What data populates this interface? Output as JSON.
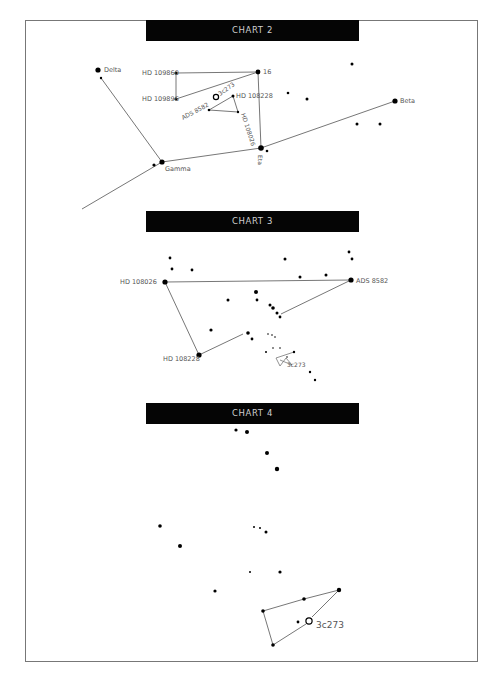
{
  "frame": {
    "x": 25,
    "y": 20,
    "w": 453,
    "h": 642
  },
  "colors": {
    "header_bg": "#050505",
    "header_text": "#cfcfcf",
    "line": "#777777",
    "star": "#000000",
    "label": "#555555"
  },
  "charts": [
    {
      "title": "CHART 2",
      "header": {
        "x": 146,
        "y": 20,
        "w": 213,
        "h": 21
      },
      "stars": [
        {
          "x": 98,
          "y": 70,
          "r": 2.6,
          "label": "Delta",
          "lx": 104,
          "ly": 72,
          "fs": 6.5
        },
        {
          "x": 101,
          "y": 78,
          "r": 1.2
        },
        {
          "x": 176,
          "y": 73,
          "r": 1.6,
          "label": "HD 109860",
          "lx": 142,
          "ly": 75,
          "fs": 6.5
        },
        {
          "x": 176,
          "y": 99,
          "r": 1.6,
          "label": "HD 109896",
          "lx": 142,
          "ly": 101,
          "fs": 6.5
        },
        {
          "x": 258,
          "y": 72,
          "r": 2.4,
          "label": "16",
          "lx": 263,
          "ly": 74,
          "fs": 6.5
        },
        {
          "x": 233,
          "y": 96,
          "r": 1.5,
          "label": "HD 108228",
          "lx": 236,
          "ly": 98,
          "fs": 6.5
        },
        {
          "x": 216,
          "y": 97,
          "r": 2,
          "ring": true,
          "label": "3c273",
          "lx": 220,
          "ly": 96,
          "fs": 6,
          "rot": -35
        },
        {
          "x": 209,
          "y": 110,
          "r": 1.3,
          "label": "ADS 8582",
          "lx": 183,
          "ly": 120,
          "fs": 6,
          "rot": -28
        },
        {
          "x": 238,
          "y": 112,
          "r": 1.2,
          "label": "HD 108026",
          "lx": 241,
          "ly": 114,
          "fs": 6,
          "rot": 72
        },
        {
          "x": 261,
          "y": 148,
          "r": 2.8,
          "label": "Eta",
          "lx": 258,
          "ly": 155,
          "fs": 6,
          "rot": 90
        },
        {
          "x": 267,
          "y": 151,
          "r": 1.3
        },
        {
          "x": 288,
          "y": 93,
          "r": 1.3
        },
        {
          "x": 307,
          "y": 99,
          "r": 1.5
        },
        {
          "x": 352,
          "y": 64,
          "r": 1.5
        },
        {
          "x": 395,
          "y": 101,
          "r": 2.6,
          "label": "Beta",
          "lx": 400,
          "ly": 103,
          "fs": 6.5
        },
        {
          "x": 357,
          "y": 124,
          "r": 1.5
        },
        {
          "x": 380,
          "y": 124,
          "r": 1.5
        },
        {
          "x": 162,
          "y": 162,
          "r": 2.6,
          "label": "Gamma",
          "lx": 165,
          "ly": 171,
          "fs": 6.5
        },
        {
          "x": 154,
          "y": 165,
          "r": 1.6
        }
      ],
      "lines": [
        [
          [
            101,
            78
          ],
          [
            162,
            162
          ]
        ],
        [
          [
            176,
            73
          ],
          [
            258,
            72
          ]
        ],
        [
          [
            176,
            73
          ],
          [
            176,
            99
          ]
        ],
        [
          [
            176,
            99
          ],
          [
            258,
            72
          ]
        ],
        [
          [
            258,
            72
          ],
          [
            261,
            148
          ]
        ],
        [
          [
            233,
            96
          ],
          [
            209,
            110
          ]
        ],
        [
          [
            209,
            110
          ],
          [
            238,
            112
          ]
        ],
        [
          [
            233,
            96
          ],
          [
            238,
            112
          ]
        ],
        [
          [
            82,
            209
          ],
          [
            162,
            162
          ]
        ],
        [
          [
            162,
            162
          ],
          [
            261,
            148
          ]
        ],
        [
          [
            261,
            148
          ],
          [
            395,
            101
          ]
        ]
      ]
    },
    {
      "title": "CHART 3",
      "header": {
        "x": 146,
        "y": 211,
        "w": 213,
        "h": 21
      },
      "stars": [
        {
          "x": 165,
          "y": 282,
          "r": 2.6,
          "label": "HD 108026",
          "lx": 120,
          "ly": 284,
          "fs": 6.5
        },
        {
          "x": 351,
          "y": 280,
          "r": 2.6,
          "label": "ADS 8582",
          "lx": 356,
          "ly": 283,
          "fs": 6.5
        },
        {
          "x": 199,
          "y": 355,
          "r": 2.6,
          "label": "HD 108228",
          "lx": 163,
          "ly": 361,
          "fs": 6.5
        },
        {
          "x": 170,
          "y": 258,
          "r": 1.4
        },
        {
          "x": 172,
          "y": 269,
          "r": 1.4
        },
        {
          "x": 192,
          "y": 270,
          "r": 1.4
        },
        {
          "x": 285,
          "y": 259,
          "r": 1.5
        },
        {
          "x": 349,
          "y": 252,
          "r": 1.4
        },
        {
          "x": 352,
          "y": 259,
          "r": 1.4
        },
        {
          "x": 300,
          "y": 277,
          "r": 1.5
        },
        {
          "x": 326,
          "y": 275,
          "r": 1.5
        },
        {
          "x": 256,
          "y": 292,
          "r": 2
        },
        {
          "x": 228,
          "y": 300,
          "r": 1.5
        },
        {
          "x": 257,
          "y": 300,
          "r": 1.4
        },
        {
          "x": 270,
          "y": 305,
          "r": 1.5
        },
        {
          "x": 273,
          "y": 308,
          "r": 1.8
        },
        {
          "x": 277,
          "y": 313,
          "r": 1.5
        },
        {
          "x": 280,
          "y": 317,
          "r": 1.4
        },
        {
          "x": 211,
          "y": 330,
          "r": 1.6
        },
        {
          "x": 248,
          "y": 333,
          "r": 1.8
        },
        {
          "x": 252,
          "y": 339,
          "r": 1.4
        },
        {
          "x": 268,
          "y": 334,
          "r": 0.8
        },
        {
          "x": 272,
          "y": 335,
          "r": 0.8
        },
        {
          "x": 275,
          "y": 337,
          "r": 0.8
        },
        {
          "x": 266,
          "y": 352,
          "r": 1
        },
        {
          "x": 273,
          "y": 348,
          "r": 0.8
        },
        {
          "x": 280,
          "y": 348,
          "r": 0.8
        },
        {
          "x": 294,
          "y": 352,
          "r": 1.2
        },
        {
          "x": 287,
          "y": 357,
          "r": 0.8,
          "label": "3c273",
          "lx": 287,
          "ly": 367,
          "fs": 6
        },
        {
          "x": 310,
          "y": 372,
          "r": 1.2
        },
        {
          "x": 315,
          "y": 380,
          "r": 1.2
        }
      ],
      "lines": [
        [
          [
            165,
            282
          ],
          [
            351,
            280
          ]
        ],
        [
          [
            165,
            282
          ],
          [
            199,
            355
          ]
        ],
        [
          [
            199,
            355
          ],
          [
            243,
            334
          ]
        ],
        [
          [
            351,
            280
          ],
          [
            281,
            314
          ]
        ]
      ],
      "polylines": [
        [
          [
            294,
            352
          ],
          [
            276,
            358
          ],
          [
            280,
            366
          ],
          [
            286,
            358
          ],
          [
            292,
            365
          ],
          [
            280,
            360
          ]
        ]
      ]
    },
    {
      "title": "CHART 4",
      "header": {
        "x": 146,
        "y": 403,
        "w": 213,
        "h": 21
      },
      "stars": [
        {
          "x": 236,
          "y": 430,
          "r": 1.6
        },
        {
          "x": 247,
          "y": 432,
          "r": 2
        },
        {
          "x": 267,
          "y": 453,
          "r": 2
        },
        {
          "x": 277,
          "y": 469,
          "r": 2.2
        },
        {
          "x": 160,
          "y": 526,
          "r": 1.8
        },
        {
          "x": 180,
          "y": 546,
          "r": 2
        },
        {
          "x": 254,
          "y": 527,
          "r": 1
        },
        {
          "x": 260,
          "y": 528,
          "r": 1
        },
        {
          "x": 266,
          "y": 532,
          "r": 1.5
        },
        {
          "x": 250,
          "y": 572,
          "r": 1
        },
        {
          "x": 280,
          "y": 572,
          "r": 1.6
        },
        {
          "x": 215,
          "y": 591,
          "r": 1.6
        },
        {
          "x": 339,
          "y": 590,
          "r": 2.2
        },
        {
          "x": 304,
          "y": 599,
          "r": 1.8
        },
        {
          "x": 263,
          "y": 611,
          "r": 1.8
        },
        {
          "x": 298,
          "y": 622,
          "r": 1.4
        },
        {
          "x": 309,
          "y": 621,
          "r": 2.5,
          "ring": true,
          "label": "3c273",
          "lx": 316,
          "ly": 628,
          "fs": 9
        },
        {
          "x": 273,
          "y": 645,
          "r": 1.8
        }
      ],
      "lines": [
        [
          [
            263,
            611
          ],
          [
            304,
            599
          ]
        ],
        [
          [
            304,
            599
          ],
          [
            339,
            590
          ]
        ],
        [
          [
            263,
            611
          ],
          [
            273,
            645
          ]
        ],
        [
          [
            273,
            645
          ],
          [
            306,
            624
          ]
        ],
        [
          [
            312,
            617
          ],
          [
            339,
            590
          ]
        ]
      ]
    }
  ]
}
